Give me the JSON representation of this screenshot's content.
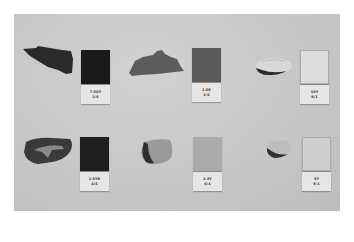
{
  "scene": {
    "description": "Photograph of six pottery sherds on a grey board, each paired with a Munsell color reference chip",
    "background_color": "#ffffff",
    "board_color": "#c9c9c9"
  },
  "samples": [
    {
      "row": 1,
      "col": 1,
      "chip": {
        "hue": "7.5GY",
        "value_chroma": "2/6",
        "swatch_color": "#1a1a1a"
      },
      "sherd_color": "#2a2a2a"
    },
    {
      "row": 1,
      "col": 2,
      "chip": {
        "hue": "2.5R",
        "value_chroma": "3/6",
        "swatch_color": "#5a5a5a"
      },
      "sherd_color": "#5c5c5c"
    },
    {
      "row": 1,
      "col": 3,
      "chip": {
        "hue": "10Y",
        "value_chroma": "9/1",
        "swatch_color": "#dcdcdc"
      },
      "sherd_color": "#d6d6d6"
    },
    {
      "row": 2,
      "col": 1,
      "chip": {
        "hue": "2.5YR",
        "value_chroma": "4/6",
        "swatch_color": "#1e1e1e"
      },
      "sherd_color": "#3a3a3a"
    },
    {
      "row": 2,
      "col": 2,
      "chip": {
        "hue": "2.5Y",
        "value_chroma": "6/4",
        "swatch_color": "#ababab"
      },
      "sherd_color": "#8f8f8f"
    },
    {
      "row": 2,
      "col": 3,
      "chip": {
        "hue": "5Y",
        "value_chroma": "9/1",
        "swatch_color": "#cfcfcf"
      },
      "sherd_color": "#bdbdbd"
    }
  ]
}
